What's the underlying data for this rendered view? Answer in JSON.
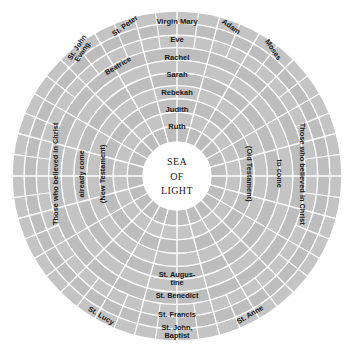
{
  "figure": {
    "name": "celestial-rose-diagram",
    "shape": "concentric-rings",
    "colors": {
      "ring_fill": "#bdbdbd",
      "ring_fill_alt": "#c4c4c4",
      "divider": "#ffffff",
      "center_fill": "#ffffff",
      "text": "#15171a",
      "background": "#ffffff"
    },
    "geometry": {
      "center_x": 177,
      "center_y": 176,
      "outer_radius": 165,
      "center_hole_radius": 34,
      "ring_count": 10,
      "spoke_count": 24
    }
  },
  "center": {
    "line1": "SEA",
    "line2": "OF",
    "line3": "LIGHT"
  },
  "labels": {
    "top_column": [
      {
        "text": "Virgin Mary",
        "ring": 0
      },
      {
        "text": "Eve",
        "ring": 1
      },
      {
        "text": "Rachel",
        "ring": 2
      },
      {
        "text": "Sarah",
        "ring": 3
      },
      {
        "text": "Rebekah",
        "ring": 4
      },
      {
        "text": "Judith",
        "ring": 5
      },
      {
        "text": "Ruth",
        "ring": 6
      }
    ],
    "bottom_column": [
      {
        "text": "St. Augus-\ntine",
        "ring": 2
      },
      {
        "text": "St. Benedict",
        "ring": 1
      },
      {
        "text": "St. Francis",
        "ring": 0
      },
      {
        "text": "St. John,\nBaptist",
        "ring": 0
      }
    ],
    "outer_ring_left": [
      {
        "text": "St. John\nEvang."
      },
      {
        "text": "St. Peter"
      },
      {
        "text": "St. Lucy"
      }
    ],
    "outer_ring_right": [
      {
        "text": "Adam"
      },
      {
        "text": "Moses"
      },
      {
        "text": "St. Anne"
      }
    ],
    "second_ring_left": [
      {
        "text": "Beatrice"
      }
    ],
    "left_arcs": [
      {
        "text": "Those who believed in Christ"
      },
      {
        "text": "already come"
      },
      {
        "text": "(New Testament)"
      }
    ],
    "right_arcs": [
      {
        "text": "(Old Testament)"
      },
      {
        "text": "to come"
      },
      {
        "text": "Those who believed in Christ"
      }
    ]
  }
}
